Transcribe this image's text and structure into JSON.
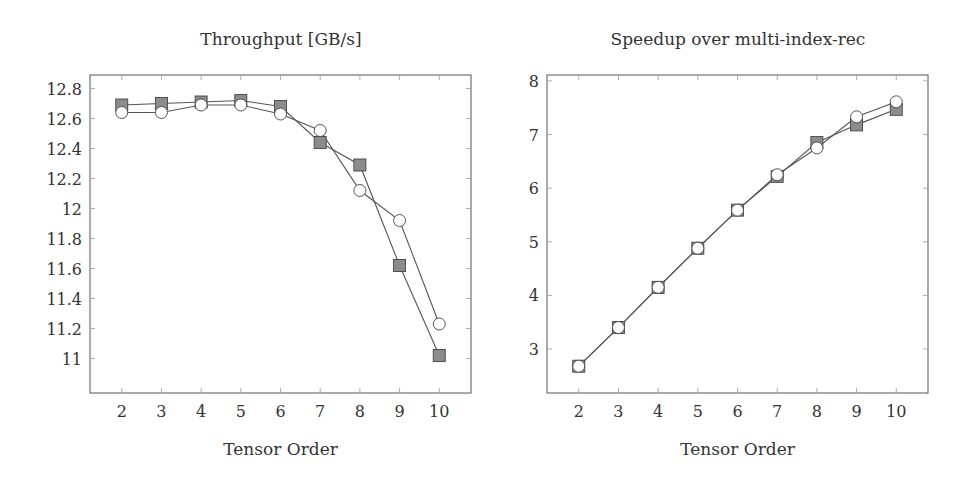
{
  "chart_data": [
    {
      "type": "line",
      "title": "Throughput [GB/s]",
      "xlabel": "Tensor Order",
      "ylabel": "",
      "x": [
        2,
        3,
        4,
        5,
        6,
        7,
        8,
        9,
        10
      ],
      "xticks": [
        "2",
        "3",
        "4",
        "5",
        "6",
        "7",
        "8",
        "9",
        "10"
      ],
      "yticks": [
        "11",
        "11.2",
        "11.4",
        "11.6",
        "11.8",
        "12",
        "12.2",
        "12.4",
        "12.6",
        "12.8"
      ],
      "ylim": [
        10.77,
        12.89
      ],
      "xlim": [
        1.2,
        10.8
      ],
      "grid": false,
      "legend": "none",
      "series": [
        {
          "name": "square-marker series",
          "marker": "square",
          "values": [
            12.69,
            12.7,
            12.71,
            12.72,
            12.68,
            12.44,
            12.29,
            11.62,
            11.02
          ]
        },
        {
          "name": "circle-marker series",
          "marker": "circle",
          "values": [
            12.64,
            12.64,
            12.69,
            12.69,
            12.63,
            12.52,
            12.12,
            11.92,
            11.23
          ]
        }
      ]
    },
    {
      "type": "line",
      "title": "Speedup over multi-index-rec",
      "xlabel": "Tensor Order",
      "ylabel": "",
      "x": [
        2,
        3,
        4,
        5,
        6,
        7,
        8,
        9,
        10
      ],
      "xticks": [
        "2",
        "3",
        "4",
        "5",
        "6",
        "7",
        "8",
        "9",
        "10"
      ],
      "yticks": [
        "3",
        "4",
        "5",
        "6",
        "7",
        "8"
      ],
      "ylim": [
        2.18,
        8.11
      ],
      "xlim": [
        1.2,
        10.8
      ],
      "grid": false,
      "legend": "none",
      "series": [
        {
          "name": "square-marker series",
          "marker": "square",
          "values": [
            2.68,
            3.4,
            4.15,
            4.88,
            5.59,
            6.22,
            6.85,
            7.18,
            7.47
          ]
        },
        {
          "name": "circle-marker series",
          "marker": "circle",
          "values": [
            2.68,
            3.4,
            4.15,
            4.88,
            5.59,
            6.25,
            6.75,
            7.33,
            7.61
          ]
        }
      ]
    }
  ],
  "colors": {
    "square_fill": "#8c8c8c",
    "circle_fill": "#ffffff",
    "line": "#555555",
    "axis": "#555555"
  }
}
